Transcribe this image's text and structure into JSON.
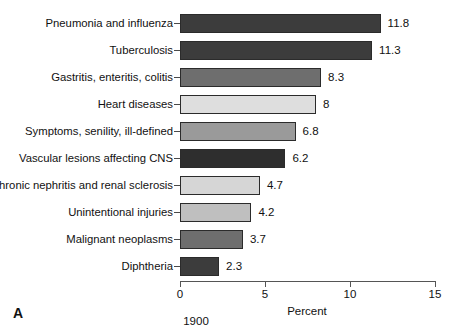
{
  "chart_data": {
    "type": "bar",
    "orientation": "horizontal",
    "title": "",
    "xlabel": "Percent",
    "ylabel": "",
    "xlim": [
      0,
      15
    ],
    "xticks": [
      0,
      5,
      10,
      15
    ],
    "xtick_labels": [
      "0",
      "5",
      "10",
      "15"
    ],
    "grid": false,
    "legend": false,
    "panel_label": "A",
    "caption": "1900",
    "categories": [
      "Pneumonia and influenza",
      "Tuberculosis",
      "Gastritis, enteritis, colitis",
      "Heart diseases",
      "Symptoms, senility, ill-defined",
      "Vascular lesions affecting CNS",
      "Chronic nephritis and renal sclerosis",
      "Unintentional injuries",
      "Malignant neoplasms",
      "Diphtheria"
    ],
    "values": [
      11.8,
      11.3,
      8.3,
      8,
      6.8,
      6.2,
      4.7,
      4.2,
      3.7,
      2.3
    ],
    "value_labels": [
      "11.8",
      "11.3",
      "8.3",
      "8",
      "6.8",
      "6.2",
      "4.7",
      "4.2",
      "3.7",
      "2.3"
    ],
    "bar_colors": [
      "#3c3c3c",
      "#3c3c3c",
      "#6e6e6e",
      "#dedede",
      "#9a9a9a",
      "#2e2e2e",
      "#d6d6d6",
      "#bfbfbf",
      "#6e6e6e",
      "#3c3c3c"
    ]
  }
}
